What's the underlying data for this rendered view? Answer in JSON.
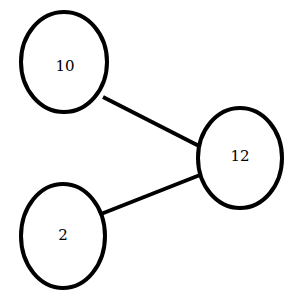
{
  "canvas": {
    "width": 296,
    "height": 306,
    "background_color": "#ffffff"
  },
  "chart_data": {
    "type": "diagram",
    "diagram_kind": "undirected-graph",
    "title": "",
    "node_shape": "ellipse",
    "node_fill_color": "#ffffff",
    "node_stroke_color": "#000000",
    "node_stroke_width": 4,
    "edge_stroke_color": "#000000",
    "edge_stroke_width": 4,
    "label_color": "#000000",
    "nodes": [
      {
        "id": "n10",
        "label": "10",
        "cx": 64,
        "cy": 62,
        "rx": 43,
        "ry": 50,
        "label_x": 65,
        "label_y": 67
      },
      {
        "id": "n12",
        "label": "12",
        "cx": 240,
        "cy": 158,
        "rx": 42,
        "ry": 50,
        "label_x": 240,
        "label_y": 157
      },
      {
        "id": "n2",
        "label": "2",
        "cx": 63,
        "cy": 236,
        "rx": 42,
        "ry": 52,
        "label_x": 63,
        "label_y": 236
      }
    ],
    "edges": [
      {
        "id": "e-10-12",
        "source": "n10",
        "target": "n12",
        "x1": 103,
        "y1": 97,
        "x2": 201,
        "y2": 147
      },
      {
        "id": "e-2-12",
        "source": "n2",
        "target": "n12",
        "x1": 101,
        "y1": 214,
        "x2": 200,
        "y2": 175
      }
    ],
    "node_labels": [
      "10",
      "12",
      "2"
    ],
    "edge_list": [
      [
        "10",
        "12"
      ],
      [
        "2",
        "12"
      ]
    ],
    "node_count": 3,
    "edge_count": 2
  }
}
